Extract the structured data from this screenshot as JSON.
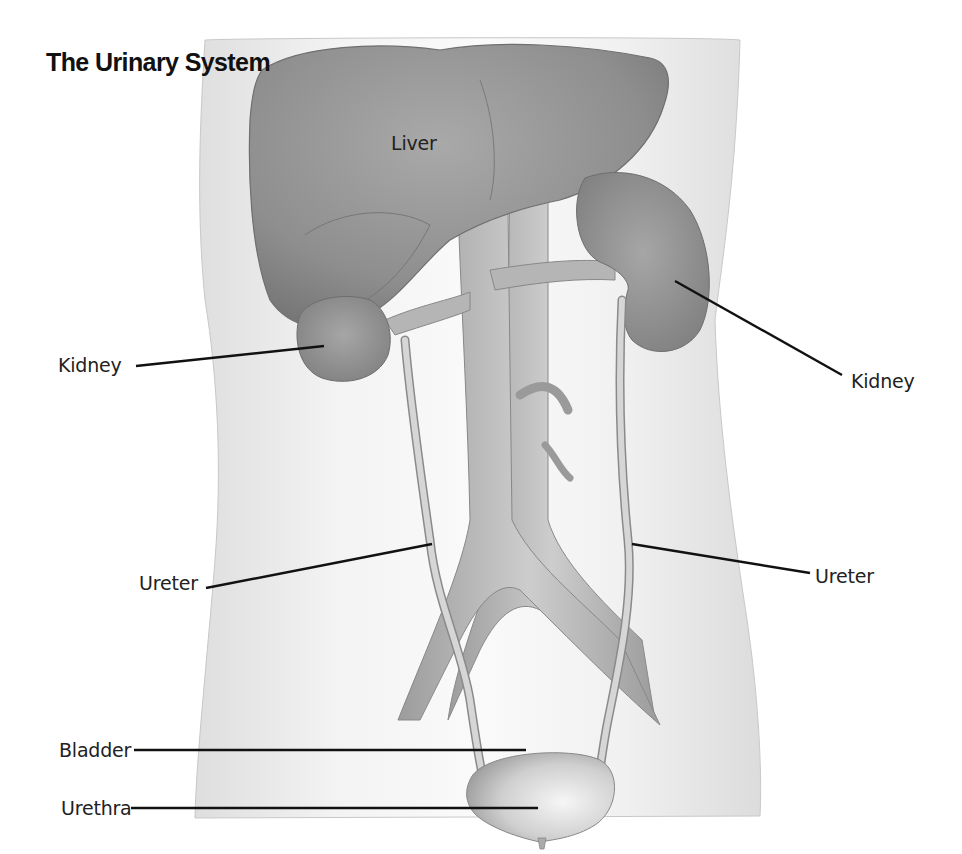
{
  "title": "The Urinary System",
  "labels": {
    "liver": "Liver",
    "kidney_left": "Kidney",
    "kidney_right": "Kidney",
    "ureter_left": "Ureter",
    "ureter_right": "Ureter",
    "bladder": "Bladder",
    "urethra": "Urethra"
  },
  "colors": {
    "background": "#ffffff",
    "torso": "#ececec",
    "organ_dark": "#8e8e8e",
    "organ_mid": "#b0b0b0",
    "vessel": "#c4c4c4",
    "leader_line": "#111111"
  }
}
